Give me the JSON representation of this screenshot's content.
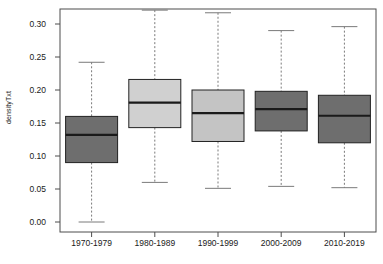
{
  "chart_data": {
    "type": "boxplot",
    "title": "",
    "xlabel": "",
    "ylabel": "densityTxt",
    "categories": [
      "1970-1979",
      "1980-1989",
      "1990-1999",
      "2000-2009",
      "2010-2019"
    ],
    "ylim": [
      -0.01,
      0.325
    ],
    "yticks": [
      0.0,
      0.05,
      0.1,
      0.15,
      0.2,
      0.25,
      0.3
    ],
    "ytick_labels": [
      "0.00",
      "0.05",
      "0.10",
      "0.15",
      "0.20",
      "0.25",
      "0.30"
    ],
    "grid": false,
    "legend": "none",
    "boxes": [
      {
        "category": "1970-1979",
        "whisker_low": 0.0,
        "q1": 0.09,
        "median": 0.132,
        "q3": 0.16,
        "whisker_high": 0.242,
        "fill": "#6e6e6e",
        "edge": "#222222"
      },
      {
        "category": "1980-1989",
        "whisker_low": 0.06,
        "q1": 0.143,
        "median": 0.181,
        "q3": 0.216,
        "whisker_high": 0.321,
        "fill": "#d0d0d0",
        "edge": "#222222"
      },
      {
        "category": "1990-1999",
        "whisker_low": 0.051,
        "q1": 0.122,
        "median": 0.165,
        "q3": 0.2,
        "whisker_high": 0.317,
        "fill": "#c4c4c4",
        "edge": "#222222"
      },
      {
        "category": "2000-2009",
        "whisker_low": 0.054,
        "q1": 0.138,
        "median": 0.171,
        "q3": 0.198,
        "whisker_high": 0.29,
        "fill": "#6e6e6e",
        "edge": "#222222"
      },
      {
        "category": "2010-2019",
        "whisker_low": 0.052,
        "q1": 0.12,
        "median": 0.161,
        "q3": 0.192,
        "whisker_high": 0.296,
        "fill": "#6e6e6e",
        "edge": "#222222"
      }
    ]
  },
  "axes": {
    "frame_color": "#4d4d4d",
    "tick_color": "#4d4d4d",
    "whisker_color": "#7a7a7a",
    "median_color": "#1a1a1a"
  }
}
